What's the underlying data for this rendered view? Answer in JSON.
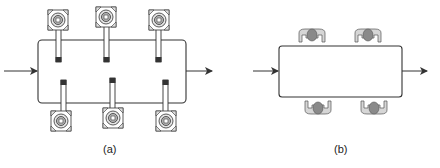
{
  "panels": [
    {
      "id": "a",
      "caption": "(a)",
      "description": "process box with six robotic arms",
      "robots_top": 3,
      "robots_bottom": 3
    },
    {
      "id": "b",
      "caption": "(b)",
      "description": "process box with four human workers",
      "workers_top": 2,
      "workers_bottom": 2
    }
  ],
  "colors": {
    "stroke": "#333333",
    "robot_fill": "#dddddd",
    "worker_body": "#cfcfcf",
    "worker_head": "#8a8a8a"
  }
}
